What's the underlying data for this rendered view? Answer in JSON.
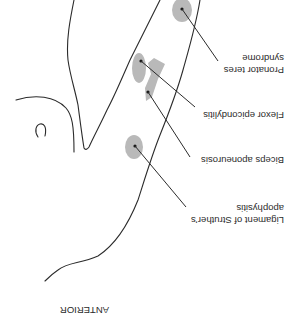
{
  "figure": {
    "orientation": "rotated 180 degrees",
    "orientation_label": "ANTERIOR",
    "labels": {
      "pronator_line1": "Pronator teres",
      "pronator_line2": "syndrome",
      "flexor": "Flexor epicondylitis",
      "biceps": "Biceps aponeurosis",
      "ligament_line1": "Ligament of Struther’s",
      "ligament_line2": "apophysitis"
    },
    "colors": {
      "outline": "#2b2b2b",
      "lesion": "#b9b9b9"
    }
  }
}
